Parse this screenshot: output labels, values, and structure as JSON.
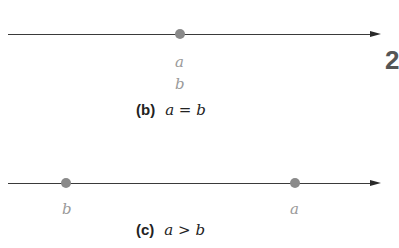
{
  "panels": [
    {
      "id": "b",
      "tag": "(b)",
      "expression": "a = b",
      "points": [
        {
          "labels": [
            "a",
            "b"
          ],
          "position": "coincident"
        }
      ],
      "labels": {
        "top": "a",
        "bottom": "b"
      }
    },
    {
      "id": "c",
      "tag": "(c)",
      "expression": "a > b",
      "points": [
        {
          "label": "b",
          "position": "left"
        },
        {
          "label": "a",
          "position": "right"
        }
      ],
      "labels": {
        "left": "b",
        "right": "a"
      }
    }
  ],
  "partial_edge_text": "2",
  "colors": {
    "line": "#3a3a3a",
    "dot": "#8a8a8a",
    "variable_label": "#9a9a9a",
    "caption": "#222222"
  }
}
